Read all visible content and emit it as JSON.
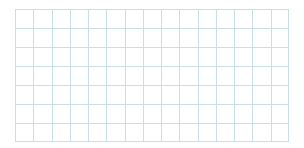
{
  "grid": {
    "columns": 15,
    "rows": 7,
    "line_color": "#c9dfe3",
    "background": "#ffffff"
  }
}
